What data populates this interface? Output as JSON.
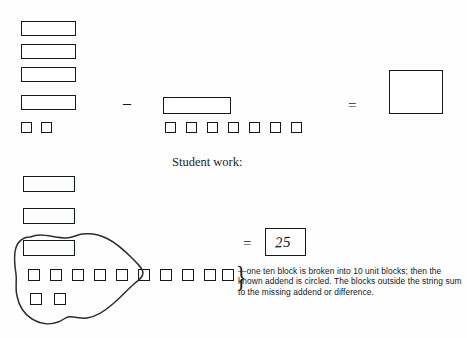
{
  "figure": {
    "caption": "Student work:",
    "top_problem": {
      "minuend": {
        "label": "minuend-blocks",
        "ten_blocks": 4,
        "unit_blocks": 2,
        "value": 42
      },
      "operator_minus": "–",
      "subtrahend": {
        "label": "subtrahend-blocks",
        "ten_blocks": 1,
        "unit_blocks": 7,
        "value": 17
      },
      "operator_equals": "=",
      "result": {
        "label": "empty-answer-box",
        "value": ""
      }
    },
    "student_work": {
      "ten_blocks": 3,
      "unit_row_blocks": 10,
      "unit_lower_blocks": 2,
      "circled_ten_blocks": 1,
      "circled_unit_row_blocks": 5,
      "circled_unit_lower_blocks": 2,
      "outside_unit_blocks": 5,
      "operator_equals": "=",
      "answer_value": "25",
      "brace": "}",
      "annotation": "—one ten block is broken into 10 unit blocks; then the known addend is circled. The blocks outside the string sum to the missing addend or difference."
    }
  },
  "colors": {
    "ink": "#15181c",
    "paper": "#ffffff",
    "pencil": "#2a2d31"
  }
}
